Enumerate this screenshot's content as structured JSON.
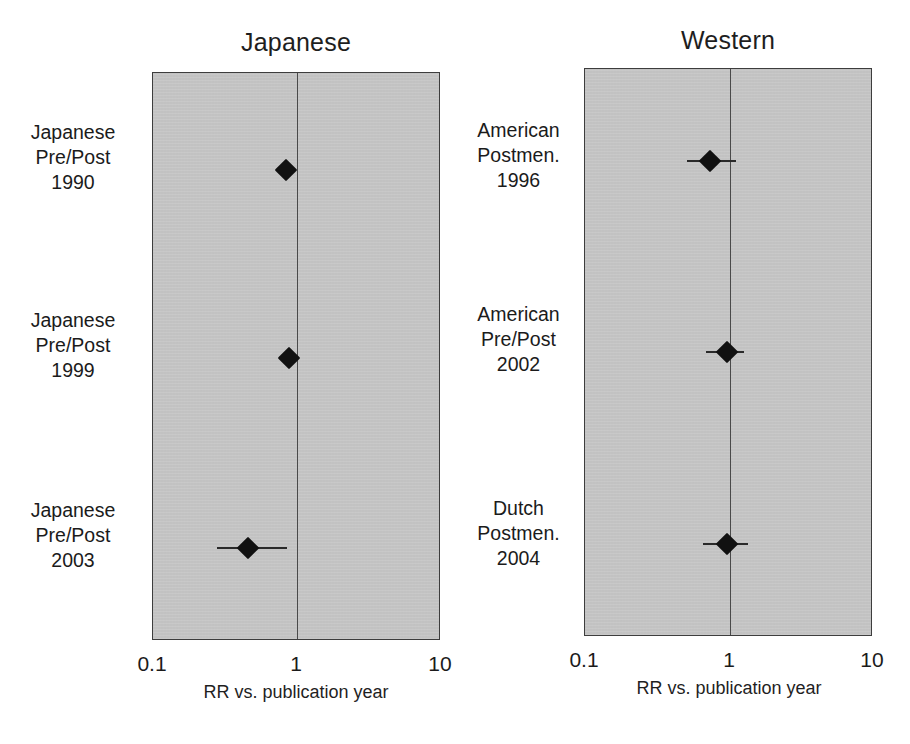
{
  "chart_data": {
    "type": "scatter",
    "subtype": "forest-plot",
    "title": "",
    "xlabel": "RR vs. publication year",
    "ylabel": "",
    "xscale": "log",
    "xlim": [
      0.1,
      10
    ],
    "xticks": [
      0.1,
      1,
      10
    ],
    "xtick_labels": [
      "0.1",
      "1",
      "10"
    ],
    "grid": false,
    "legend": null,
    "reference_line": 1,
    "panels": [
      {
        "name": "Japanese",
        "title": "Japanese",
        "rows": [
          {
            "label_lines": [
              "Japanese",
              "Pre/Post",
              "1990"
            ],
            "study": "Japanese Pre/Post",
            "year": "1990",
            "rr": 0.85,
            "ci_low": 0.85,
            "ci_high": 0.85,
            "has_ci": false
          },
          {
            "label_lines": [
              "Japanese",
              "Pre/Post",
              "1999"
            ],
            "study": "Japanese Pre/Post",
            "year": "1999",
            "rr": 0.9,
            "ci_low": 0.87,
            "ci_high": 0.94,
            "has_ci": true
          },
          {
            "label_lines": [
              "Japanese",
              "Pre/Post",
              "2003"
            ],
            "study": "Japanese Pre/Post",
            "year": "2003",
            "rr": 0.46,
            "ci_low": 0.28,
            "ci_high": 0.87,
            "has_ci": true
          }
        ]
      },
      {
        "name": "Western",
        "title": "Western",
        "rows": [
          {
            "label_lines": [
              "American",
              "Postmen.",
              "1996"
            ],
            "study": "American Postmen.",
            "year": "1996",
            "rr": 0.75,
            "ci_low": 0.52,
            "ci_high": 1.14,
            "has_ci": true
          },
          {
            "label_lines": [
              "American",
              "Pre/Post",
              "2002"
            ],
            "study": "American Pre/Post",
            "year": "2002",
            "rr": 0.98,
            "ci_low": 0.7,
            "ci_high": 1.29,
            "has_ci": true
          },
          {
            "label_lines": [
              "Dutch",
              "Postmen.",
              "2004"
            ],
            "study": "Dutch Postmen.",
            "year": "2004",
            "rr": 0.98,
            "ci_low": 0.67,
            "ci_high": 1.37,
            "has_ci": true
          }
        ]
      }
    ]
  },
  "panels": {
    "left": {
      "title": "Japanese",
      "axis": {
        "tick_low": "0.1",
        "tick_mid": "1",
        "tick_high": "10",
        "caption": "RR vs. publication year"
      },
      "rows": [
        {
          "line1": "Japanese",
          "line2": "Pre/Post",
          "line3": "1990"
        },
        {
          "line1": "Japanese",
          "line2": "Pre/Post",
          "line3": "1999"
        },
        {
          "line1": "Japanese",
          "line2": "Pre/Post",
          "line3": "2003"
        }
      ]
    },
    "right": {
      "title": "Western",
      "axis": {
        "tick_low": "0.1",
        "tick_mid": "1",
        "tick_high": "10",
        "caption": "RR vs. publication year"
      },
      "rows": [
        {
          "line1": "American",
          "line2": "Postmen.",
          "line3": "1996"
        },
        {
          "line1": "American",
          "line2": "Pre/Post",
          "line3": "2002"
        },
        {
          "line1": "Dutch",
          "line2": "Postmen.",
          "line3": "2004"
        }
      ]
    }
  },
  "colors": {
    "plot_background": "#c2c2c2",
    "plot_border": "#3d3d3d",
    "marker": "#111111",
    "reference_line": "#4a4a4a",
    "text": "#1b1b1b",
    "page_background": "#ffffff"
  }
}
